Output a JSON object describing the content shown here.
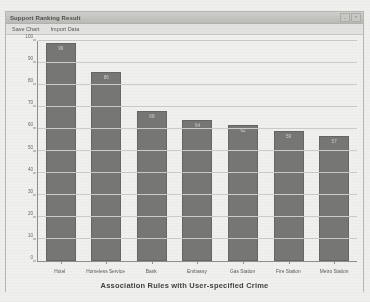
{
  "window": {
    "title": "Support Ranking Result",
    "controls": [
      {
        "name": "minimize",
        "glyph": "_"
      },
      {
        "name": "close",
        "glyph": "×"
      }
    ],
    "menu": [
      "Save Chart",
      "Import Data"
    ]
  },
  "chart_data": {
    "type": "bar",
    "title": "",
    "categories": [
      "Hotel",
      "Homeless Service",
      "Bank",
      "Embassy",
      "Gas Station",
      "Fire Station",
      "Metro Station"
    ],
    "values": [
      99,
      86,
      68,
      64,
      62,
      59,
      57
    ],
    "value_labels": [
      "99",
      "86",
      "68",
      "64",
      "62",
      "59",
      "57"
    ],
    "xlabel": "Association Rules with User-specified Crime",
    "ylabel": "Average Support Count",
    "ylim": [
      0,
      100
    ],
    "yticks": [
      0,
      10,
      20,
      30,
      40,
      50,
      60,
      70,
      80,
      90,
      100
    ],
    "grid": true,
    "legend": "none",
    "bar_color": "#6e6e6c"
  }
}
